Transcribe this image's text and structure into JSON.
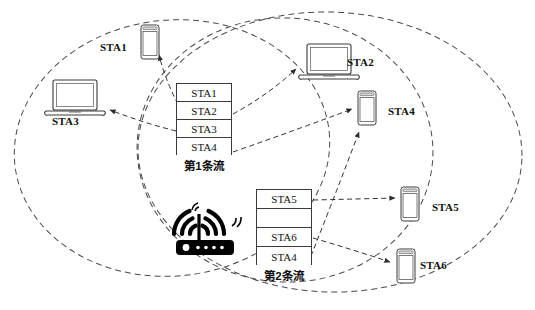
{
  "diagram": {
    "background_color": "#ffffff",
    "line_color": "#3a3a3a",
    "text_color": "#111111"
  },
  "coverage_areas": [
    {
      "name": "left-coverage-ellipse",
      "cx": 172,
      "cy": 148,
      "rx": 158,
      "ry": 128,
      "rotation": -6
    },
    {
      "name": "middle-coverage-ellipse",
      "cx": 285,
      "cy": 150,
      "rx": 148,
      "ry": 132,
      "rotation": 4
    },
    {
      "name": "right-coverage-ellipse",
      "cx": 330,
      "cy": 152,
      "rx": 192,
      "ry": 140,
      "rotation": 2
    }
  ],
  "access_point": {
    "name": "wifi-router",
    "x": 168,
    "y": 200,
    "signal_arcs": 3
  },
  "stations": [
    {
      "id": "STA1",
      "label": "STA1",
      "type": "phone",
      "icon_x": 140,
      "icon_y": 24,
      "label_x": 100,
      "label_y": 41
    },
    {
      "id": "STA2",
      "label": "STA2",
      "type": "laptop",
      "icon_x": 298,
      "icon_y": 43,
      "label_x": 347,
      "label_y": 56
    },
    {
      "id": "STA3",
      "label": "STA3",
      "type": "laptop",
      "icon_x": 44,
      "icon_y": 79,
      "label_x": 52,
      "label_y": 115
    },
    {
      "id": "STA4",
      "label": "STA4",
      "type": "phone",
      "icon_x": 357,
      "icon_y": 90,
      "label_x": 388,
      "label_y": 105
    },
    {
      "id": "STA5",
      "label": "STA5",
      "type": "phone",
      "icon_x": 400,
      "icon_y": 186,
      "label_x": 432,
      "label_y": 201
    },
    {
      "id": "STA6",
      "label": "STA6",
      "type": "phone",
      "icon_x": 396,
      "icon_y": 248,
      "label_x": 420,
      "label_y": 259
    }
  ],
  "streams": [
    {
      "name": "stream-1",
      "caption": "第1条流",
      "x": 176,
      "y": 83,
      "width": 56,
      "height": 72,
      "caption_y": 157,
      "rows": [
        {
          "text": "STA1"
        },
        {
          "text": "STA2"
        },
        {
          "text": "STA3"
        },
        {
          "text": "STA4"
        }
      ]
    },
    {
      "name": "stream-2",
      "caption": "第2条流",
      "x": 256,
      "y": 189,
      "width": 56,
      "height": 76,
      "caption_y": 267,
      "rows": [
        {
          "text": "STA5"
        },
        {
          "text": ""
        },
        {
          "text": "STA6"
        },
        {
          "text": "STA4"
        }
      ]
    }
  ],
  "flows": [
    {
      "name": "flow-stream1-sta1",
      "from": "stream-1 row STA1",
      "to": "STA1",
      "path": "M 178 104 L 164 74 L 160 56",
      "arrow_at": [
        159,
        52
      ],
      "arrow_angle": -105
    },
    {
      "name": "flow-stream1-sta2",
      "from": "stream-1 row STA2",
      "to": "STA2",
      "path": "M 233 114 L 270 92 L 295 70",
      "arrow_at": [
        297,
        67
      ],
      "arrow_angle": -40
    },
    {
      "name": "flow-stream1-sta3",
      "from": "stream-1 row STA3",
      "to": "STA3",
      "path": "M 176 131 L 145 122 L 112 111",
      "arrow_at": [
        108,
        110
      ],
      "arrow_angle": 197
    },
    {
      "name": "flow-stream1-sta4",
      "from": "stream-1 row STA4",
      "to": "STA4",
      "path": "M 233 152 L 300 128 L 350 110",
      "arrow_at": [
        354,
        108
      ],
      "arrow_angle": -20
    },
    {
      "name": "flow-stream2-sta5",
      "from": "stream-2 row STA5",
      "to": "STA5",
      "path": "M 313 200 L 360 199 L 393 198",
      "arrow_at": [
        397,
        198
      ],
      "arrow_angle": 0
    },
    {
      "name": "flow-stream2-sta6",
      "from": "stream-2 row STA6",
      "to": "STA6",
      "path": "M 313 238 L 355 250 L 388 262",
      "arrow_at": [
        392,
        263
      ],
      "arrow_angle": 20
    },
    {
      "name": "flow-stream2-sta4",
      "from": "stream-2 row STA4",
      "to": "STA4",
      "path": "M 311 256 L 340 200 L 359 134",
      "arrow_at": [
        360,
        130
      ],
      "arrow_angle": -74
    }
  ]
}
